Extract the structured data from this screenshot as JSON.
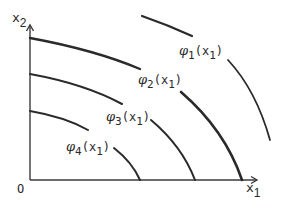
{
  "diagram": {
    "type": "level-curves",
    "axes": {
      "origin_label": "O",
      "x_label": "x",
      "x_sub": "1",
      "y_label": "x",
      "y_sub": "2"
    },
    "curves": [
      {
        "id": "phi1",
        "symbol": "φ",
        "sub": "1",
        "arg": "(x",
        "arg_sub": "1",
        "close": ")",
        "label_full": "φ1(x1)"
      },
      {
        "id": "phi2",
        "symbol": "φ",
        "sub": "2",
        "arg": "(x",
        "arg_sub": "1",
        "close": ")",
        "label_full": "φ2(x1)"
      },
      {
        "id": "phi3",
        "symbol": "φ",
        "sub": "3",
        "arg": "(x",
        "arg_sub": "1",
        "close": ")",
        "label_full": "φ3(x1)"
      },
      {
        "id": "phi4",
        "symbol": "φ",
        "sub": "4",
        "arg": "(x",
        "arg_sub": "1",
        "close": ")",
        "label_full": "φ4(x1)"
      }
    ],
    "colors": {
      "ink": "#2a2a2a",
      "background": "#ffffff"
    }
  }
}
